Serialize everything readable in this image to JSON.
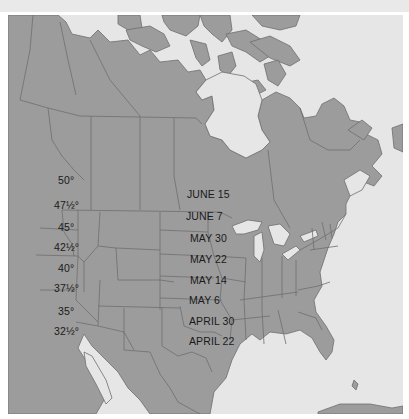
{
  "map": {
    "title": "",
    "region": "North America",
    "colors": {
      "land": "#9c9c9c",
      "water": "#e6e6e6",
      "border": "#6e6e6e",
      "text": "#1a1a1a"
    },
    "latitude_labels": [
      {
        "text": "50°"
      },
      {
        "text": "47½°"
      },
      {
        "text": "45°"
      },
      {
        "text": "42½°"
      },
      {
        "text": "40°"
      },
      {
        "text": "37½°"
      },
      {
        "text": "35°"
      },
      {
        "text": "32½°"
      }
    ],
    "date_labels": [
      {
        "text": "JUNE 15"
      },
      {
        "text": "JUNE 7"
      },
      {
        "text": "MAY 30"
      },
      {
        "text": "MAY 22"
      },
      {
        "text": "MAY 14"
      },
      {
        "text": "MAY 6"
      },
      {
        "text": "APRIL 30"
      },
      {
        "text": "APRIL 22"
      }
    ]
  }
}
